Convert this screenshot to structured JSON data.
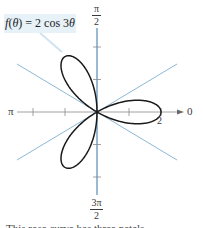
{
  "chart_data": {
    "type": "polar-line",
    "title": "",
    "equation": "f(θ) = 2 cos 3θ",
    "equation_parts": {
      "fn": "f",
      "arg": "θ",
      "rhs": "= 2 cos 3",
      "var": "θ"
    },
    "curve": {
      "r_expr": "2*cos(3*theta)",
      "theta_range": [
        0,
        3.14159
      ],
      "petals": 3,
      "petal_angles_deg": [
        0,
        120,
        240
      ],
      "max_r": 2,
      "color": "#1a1a1a"
    },
    "axis_labels": {
      "right": "0",
      "left": "π",
      "top": {
        "num": "π",
        "den": "2"
      },
      "bottom": {
        "num": "3π",
        "den": "2"
      }
    },
    "r_tick_label": "2",
    "r_ticks": [
      1,
      2
    ],
    "guide_lines_deg": [
      30,
      -30
    ],
    "colors": {
      "axis_vertical": "#6e9cc4",
      "guide_lines": "#8db8d8",
      "axis_horizontal": "#8a8a8a",
      "label_box": "#e6f1f8"
    }
  },
  "caption": "This rose curve has three petals."
}
